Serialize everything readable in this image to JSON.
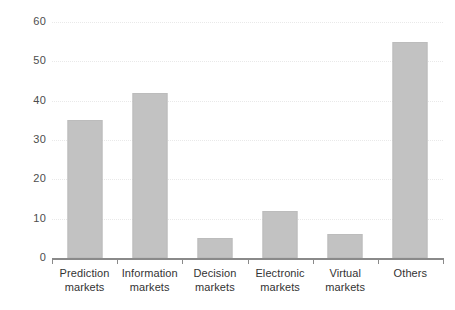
{
  "chart_data": {
    "type": "bar",
    "title": "",
    "subtitle": "",
    "xlabel": "",
    "ylabel": "",
    "categories": [
      "Prediction markets",
      "Information markets",
      "Decision markets",
      "Electronic markets",
      "Virtual markets",
      "Others"
    ],
    "category_lines": [
      [
        "Prediction",
        "markets"
      ],
      [
        "Information",
        "markets"
      ],
      [
        "Decision",
        "markets"
      ],
      [
        "Electronic",
        "markets"
      ],
      [
        "Virtual",
        "markets"
      ],
      [
        "Others",
        ""
      ]
    ],
    "values": [
      35,
      42,
      5,
      12,
      6,
      55
    ],
    "ylim": [
      0,
      60
    ],
    "ytick_labels": [
      "0",
      "10",
      "20",
      "30",
      "40",
      "50",
      "60"
    ],
    "ytick_values": [
      0,
      10,
      20,
      30,
      40,
      50,
      60
    ],
    "grid": true,
    "grid_axis": "y",
    "grid_style": "dotted",
    "legend": false,
    "legend_position": "none",
    "bar_color": "#c2c2c2",
    "bar_edge_color": "#bcbcbc",
    "grid_color": "#e9e9e9",
    "axis_color": "#8a8a8a",
    "text_color": "#333333",
    "background_color": "#ffffff"
  }
}
